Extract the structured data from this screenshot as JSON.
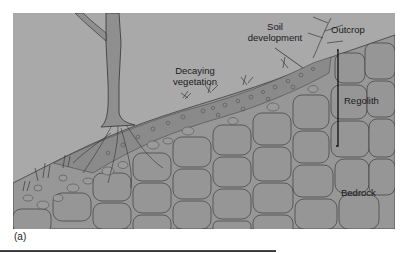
{
  "figure": {
    "labels": {
      "outcrop": "Outcrop",
      "soil_development_line1": "Soil",
      "soil_development_line2": "development",
      "decaying_vegetation_line1": "Decaying",
      "decaying_vegetation_line2": "vegetation",
      "regolith": "Regolith",
      "bedrock": "Bedrock"
    },
    "panel_label": "(a)",
    "colors": {
      "sky": "#a9a9a9",
      "rock": "#969696",
      "soil": "#8c8c8c",
      "outline": "#3c3c3c",
      "background": "#ffffff"
    }
  }
}
